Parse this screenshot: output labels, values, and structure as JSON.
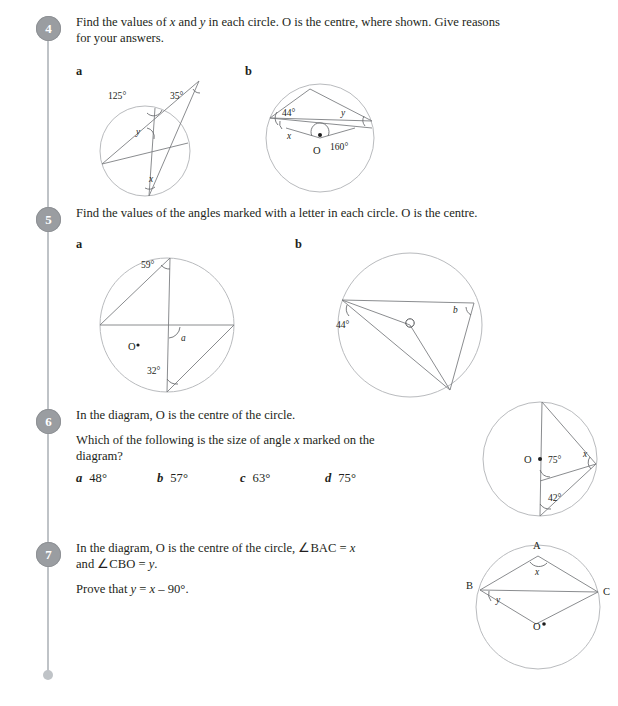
{
  "page": {
    "rail_color": "#bfc3c7",
    "badge_color": "#9a9da1",
    "text_color": "#231f20"
  },
  "questions": [
    {
      "number": "4",
      "text_line1": "Find the values of x and y in each circle. O is the centre, where shown. Give reasons",
      "text_line2": "for your answers.",
      "part_a_label": "a",
      "part_b_label": "b",
      "diagram_a": {
        "centre_label": "",
        "labels": [
          "125°",
          "35°",
          "y",
          "x"
        ]
      },
      "diagram_b": {
        "centre_label": "O",
        "labels": [
          "44°",
          "y",
          "x",
          "160°"
        ]
      }
    },
    {
      "number": "5",
      "text_line1": "Find the values of the angles marked with a letter in each circle. O is the centre.",
      "part_a_label": "a",
      "part_b_label": "b",
      "diagram_a": {
        "centre_label": "O",
        "labels": [
          "59°",
          "a",
          "32°"
        ]
      },
      "diagram_b": {
        "centre_label": "O",
        "labels": [
          "44°",
          "b"
        ]
      }
    },
    {
      "number": "6",
      "text_line1": "In the diagram, O is the centre of the circle.",
      "text_line2": "Which of the following is the size of angle x marked on the",
      "text_line3": "diagram?",
      "options": [
        {
          "letter": "a",
          "value": "48°"
        },
        {
          "letter": "b",
          "value": "57°"
        },
        {
          "letter": "c",
          "value": "63°"
        },
        {
          "letter": "d",
          "value": "75°"
        }
      ],
      "diagram": {
        "centre_label": "O",
        "labels": [
          "75°",
          "x",
          "42°"
        ]
      }
    },
    {
      "number": "7",
      "text_line1": "In the diagram, O is the centre of the circle, ∠BAC = x",
      "text_line2": "and ∠CBO = y.",
      "text_line3": "Prove that y = x – 90°.",
      "diagram": {
        "centre_label": "O",
        "labels": [
          "A",
          "B",
          "C",
          "x",
          "y"
        ]
      }
    }
  ]
}
